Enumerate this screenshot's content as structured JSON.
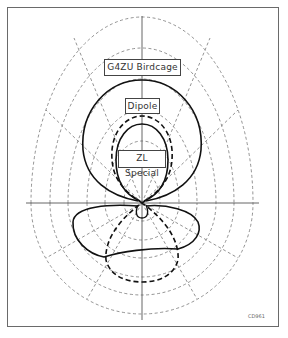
{
  "diagram": {
    "type": "polar-radiation-pattern",
    "labels": {
      "birdcage": "G4ZU Birdcage",
      "dipole": "Dipole",
      "zl_special": "ZL Special"
    },
    "figure_code": "CD961",
    "series": [
      {
        "name": "G4ZU Birdcage",
        "style": "solid-thick"
      },
      {
        "name": "Dipole",
        "style": "dashed-thick"
      },
      {
        "name": "ZL Special",
        "style": "solid-thick"
      }
    ],
    "grid": {
      "rings": 6,
      "spoke_step_deg": 30,
      "style": "dashed"
    },
    "colors": {
      "line": "#111111",
      "grid": "#777777",
      "frame": "#6a6a6a"
    }
  }
}
